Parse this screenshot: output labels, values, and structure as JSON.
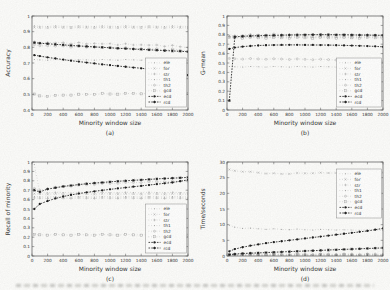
{
  "page": {
    "background": "#fbfbf9",
    "footer_illegible_caption": true
  },
  "colors": {
    "axis": "#4d4d4d",
    "text": "#333333",
    "gray_series": "#a0a0a0",
    "dark_series": "#1c1c1c",
    "legend_border": "#8a8a8a",
    "legend_fill": "#fdfdfc"
  },
  "chart_data": [
    {
      "type": "line",
      "sublabel": "(a)",
      "xlabel": "Minority window size",
      "ylabel": "Accuracy",
      "xlim": [
        0,
        2000
      ],
      "ylim": [
        0.4,
        1
      ],
      "xtick_labels": [
        "0",
        "200",
        "400",
        "600",
        "800",
        "1000",
        "1200",
        "1400",
        "1600",
        "1800",
        "2000"
      ],
      "ytick_labels": [
        "0.4",
        "0.5",
        "0.6",
        "0.7",
        "0.8",
        "0.9",
        "1"
      ],
      "legend": {
        "position": "right-bottom"
      },
      "x": [
        30,
        100,
        200,
        300,
        400,
        500,
        600,
        700,
        800,
        900,
        1000,
        1100,
        1200,
        1300,
        1400,
        1500,
        1600,
        1700,
        1800,
        1900,
        2000
      ],
      "series": [
        {
          "name": "ele",
          "marker": "dot",
          "tone": "gray",
          "flat": 0.935
        },
        {
          "name": "for",
          "marker": "x",
          "tone": "gray",
          "flat": 0.925
        },
        {
          "name": "str",
          "marker": "plus",
          "tone": "gray",
          "values": [
            0.835,
            0.829,
            0.833,
            0.826,
            0.831,
            0.824,
            0.829,
            0.822,
            0.827,
            0.82,
            0.824,
            0.817,
            0.821,
            0.815,
            0.818,
            0.812,
            0.815,
            0.808,
            0.811,
            0.804,
            0.8
          ]
        },
        {
          "name": "th1",
          "marker": "dot",
          "tone": "gray",
          "flat": 0.72
        },
        {
          "name": "th2",
          "marker": "circle",
          "tone": "gray",
          "values": [
            0.815,
            0.81,
            0.812,
            0.806,
            0.809,
            0.803,
            0.806,
            0.8,
            0.803,
            0.797,
            0.8,
            0.794,
            0.797,
            0.791,
            0.794,
            0.788,
            0.791,
            0.785,
            0.788,
            0.782,
            0.778
          ]
        },
        {
          "name": "gcd",
          "marker": "square",
          "tone": "gray",
          "values": [
            0.5,
            0.49,
            0.488,
            0.492,
            0.495,
            0.497,
            0.499,
            0.5,
            0.501,
            0.502,
            0.502,
            0.503,
            0.504,
            0.504,
            0.505,
            0.505,
            0.506,
            0.506,
            0.507,
            0.507,
            0.508
          ]
        },
        {
          "name": "ecd",
          "marker": "filled-dot",
          "tone": "dark",
          "values": [
            0.75,
            0.744,
            0.736,
            0.729,
            0.722,
            0.715,
            0.709,
            0.703,
            0.697,
            0.691,
            0.686,
            0.681,
            0.676,
            0.671,
            0.666,
            0.661,
            0.656,
            0.651,
            0.645,
            0.638,
            0.622
          ]
        },
        {
          "name": "rcd",
          "marker": "star",
          "tone": "dark",
          "values": [
            0.83,
            0.826,
            0.823,
            0.819,
            0.816,
            0.812,
            0.809,
            0.806,
            0.803,
            0.8,
            0.797,
            0.794,
            0.792,
            0.789,
            0.787,
            0.784,
            0.782,
            0.779,
            0.777,
            0.775,
            0.772
          ]
        }
      ]
    },
    {
      "type": "line",
      "sublabel": "(b)",
      "xlabel": "Minority window size",
      "ylabel": "G-mean",
      "xlim": [
        0,
        2000
      ],
      "ylim": [
        0,
        1
      ],
      "xtick_labels": [
        "0",
        "200",
        "400",
        "600",
        "800",
        "1000",
        "1200",
        "1400",
        "1600",
        "1800",
        "2000"
      ],
      "ytick_labels": [
        "0",
        "0.1",
        "0.2",
        "0.3",
        "0.4",
        "0.5",
        "0.6",
        "0.7",
        "0.8",
        "0.9",
        "1"
      ],
      "legend": {
        "position": "right-bottom"
      },
      "x": [
        30,
        100,
        200,
        300,
        400,
        500,
        600,
        700,
        800,
        900,
        1000,
        1100,
        1200,
        1300,
        1400,
        1500,
        1600,
        1700,
        1800,
        1900,
        2000
      ],
      "series": [
        {
          "name": "ele",
          "marker": "dot",
          "tone": "gray",
          "flat": 0.775
        },
        {
          "name": "for",
          "marker": "x",
          "tone": "gray",
          "flat": 0.786
        },
        {
          "name": "str",
          "marker": "plus",
          "tone": "gray",
          "values": [
            0.78,
            0.792,
            0.798,
            0.802,
            0.799,
            0.804,
            0.808,
            0.803,
            0.807,
            0.804,
            0.801,
            0.805,
            0.802,
            0.8,
            0.804,
            0.801,
            0.799,
            0.797,
            0.8,
            0.796,
            0.794
          ]
        },
        {
          "name": "th1",
          "marker": "dot",
          "tone": "gray",
          "flat": 0.46
        },
        {
          "name": "th2",
          "marker": "circle",
          "tone": "gray",
          "values": [
            0.545,
            0.545,
            0.544,
            0.544,
            0.543,
            0.543,
            0.542,
            0.542,
            0.541,
            0.54,
            0.539,
            0.538,
            0.537,
            0.536,
            0.534,
            0.532,
            0.529,
            0.526,
            0.522,
            0.519,
            0.516
          ]
        },
        {
          "name": "gcd",
          "marker": "square",
          "tone": "gray",
          "flat": 0.768
        },
        {
          "name": "ecd",
          "marker": "filled-dot",
          "tone": "dark",
          "values": [
            0.65,
            0.664,
            0.674,
            0.681,
            0.686,
            0.689,
            0.691,
            0.692,
            0.693,
            0.693,
            0.692,
            0.692,
            0.691,
            0.69,
            0.689,
            0.687,
            0.685,
            0.683,
            0.68,
            0.677,
            0.672
          ]
        },
        {
          "name": "rcd",
          "marker": "star",
          "tone": "dark",
          "values": [
            0.1,
            0.778,
            0.784,
            0.788,
            0.79,
            0.793,
            0.795,
            0.796,
            0.798,
            0.799,
            0.8,
            0.801,
            0.801,
            0.801,
            0.8,
            0.8,
            0.799,
            0.798,
            0.797,
            0.796,
            0.795
          ]
        }
      ]
    },
    {
      "type": "line",
      "sublabel": "(c)",
      "xlabel": "Minority window size",
      "ylabel": "Recall of minority",
      "xlim": [
        0,
        2000
      ],
      "ylim": [
        0,
        1
      ],
      "xtick_labels": [
        "0",
        "200",
        "400",
        "600",
        "800",
        "1000",
        "1200",
        "1400",
        "1600",
        "1800",
        "2000"
      ],
      "ytick_labels": [
        "0",
        "0.1",
        "0.2",
        "0.3",
        "0.4",
        "0.5",
        "0.6",
        "0.7",
        "0.8",
        "0.9",
        "1"
      ],
      "legend": {
        "position": "right-bottom"
      },
      "x": [
        30,
        100,
        200,
        300,
        400,
        500,
        600,
        700,
        800,
        900,
        1000,
        1100,
        1200,
        1300,
        1400,
        1500,
        1600,
        1700,
        1800,
        1900,
        2000
      ],
      "series": [
        {
          "name": "ele",
          "marker": "dot",
          "tone": "gray",
          "values": [
            0.97,
            0.676,
            0.675,
            0.676,
            0.675,
            0.674,
            0.676,
            0.675,
            0.675,
            0.676,
            0.674,
            0.675,
            0.676,
            0.675,
            0.674,
            0.676,
            0.675,
            0.675,
            0.676,
            0.674,
            0.675
          ]
        },
        {
          "name": "for",
          "marker": "x",
          "tone": "gray",
          "flat": 0.66
        },
        {
          "name": "str",
          "marker": "plus",
          "tone": "gray",
          "flat": 0.615
        },
        {
          "name": "th1",
          "marker": "dot",
          "tone": "gray",
          "flat": 0.63
        },
        {
          "name": "th2",
          "marker": "circle",
          "tone": "gray",
          "values": [
            0.715,
            0.7,
            0.718,
            0.728,
            0.738,
            0.746,
            0.752,
            0.758,
            0.763,
            0.768,
            0.772,
            0.776,
            0.779,
            0.782,
            0.784,
            0.787,
            0.789,
            0.791,
            0.793,
            0.795,
            0.797
          ]
        },
        {
          "name": "gcd",
          "marker": "square",
          "tone": "gray",
          "flat": 0.225
        },
        {
          "name": "ecd",
          "marker": "filled-dot",
          "tone": "dark",
          "values": [
            0.5,
            0.553,
            0.585,
            0.612,
            0.633,
            0.65,
            0.664,
            0.677,
            0.688,
            0.699,
            0.709,
            0.719,
            0.728,
            0.737,
            0.746,
            0.755,
            0.764,
            0.773,
            0.782,
            0.796,
            0.81
          ]
        },
        {
          "name": "rcd",
          "marker": "star",
          "tone": "dark",
          "values": [
            0.7,
            0.682,
            0.712,
            0.726,
            0.74,
            0.75,
            0.76,
            0.769,
            0.776,
            0.782,
            0.789,
            0.795,
            0.8,
            0.805,
            0.81,
            0.815,
            0.82,
            0.824,
            0.828,
            0.832,
            0.836
          ]
        }
      ]
    },
    {
      "type": "line",
      "sublabel": "(d)",
      "xlabel": "Minority window size",
      "ylabel": "Time/seconds",
      "xlim": [
        0,
        2000
      ],
      "ylim": [
        0,
        30
      ],
      "xtick_labels": [
        "0",
        "200",
        "400",
        "600",
        "800",
        "1000",
        "1200",
        "1400",
        "1600",
        "1800",
        "2000"
      ],
      "ytick_labels": [
        "0",
        "5",
        "10",
        "15",
        "20",
        "25",
        "30"
      ],
      "legend": {
        "position": "right-top"
      },
      "x": [
        30,
        100,
        200,
        300,
        400,
        500,
        600,
        700,
        800,
        900,
        1000,
        1100,
        1200,
        1300,
        1400,
        1500,
        1600,
        1700,
        1800,
        1900,
        2000
      ],
      "series": [
        {
          "name": "ele",
          "marker": "dot",
          "tone": "gray",
          "values": [
            9.7,
            9.2,
            8.9,
            8.8,
            8.7,
            8.6,
            8.6,
            8.5,
            8.5,
            8.5,
            8.4,
            8.4,
            8.4,
            8.4,
            8.4,
            8.3,
            8.3,
            8.3,
            8.3,
            8.3,
            8.3
          ]
        },
        {
          "name": "for",
          "marker": "x",
          "tone": "gray",
          "values": [
            27.5,
            27.2,
            27.0,
            26.8,
            26.6,
            26.4,
            26.3,
            26.2,
            26.3,
            26.4,
            26.4,
            26.5,
            26.5,
            26.5,
            26.6,
            26.6,
            26.5,
            26.6,
            26.7,
            26.6,
            26.7
          ]
        },
        {
          "name": "str",
          "marker": "plus",
          "tone": "gray",
          "flat": 0.4
        },
        {
          "name": "th1",
          "marker": "dot",
          "tone": "gray",
          "flat": 0.2
        },
        {
          "name": "th2",
          "marker": "circle",
          "tone": "gray",
          "flat": 0.6
        },
        {
          "name": "gcd",
          "marker": "square",
          "tone": "gray",
          "flat": 0.3
        },
        {
          "name": "ecd",
          "marker": "filled-dot",
          "tone": "dark",
          "values": [
            1.5,
            2.2,
            2.8,
            3.3,
            3.7,
            4.1,
            4.4,
            4.7,
            5.0,
            5.3,
            5.6,
            5.9,
            6.2,
            6.5,
            6.8,
            7.1,
            7.4,
            7.7,
            8.0,
            8.4,
            8.8
          ]
        },
        {
          "name": "rcd",
          "marker": "star",
          "tone": "dark",
          "values": [
            0.4,
            0.6,
            0.8,
            0.9,
            1.0,
            1.1,
            1.2,
            1.3,
            1.4,
            1.5,
            1.6,
            1.7,
            1.8,
            1.9,
            2.0,
            2.1,
            2.2,
            2.3,
            2.4,
            2.5,
            2.6
          ]
        }
      ]
    }
  ]
}
